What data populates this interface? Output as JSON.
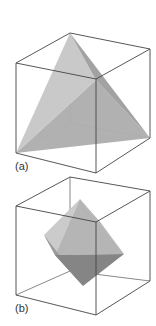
{
  "figures": [
    {
      "id": "a",
      "label": "(a)",
      "shape": "tetrahedron inscribed in cube",
      "colors": {
        "left_face": "#c4c4c4",
        "right_face": "#9e9e9e",
        "bottom_face": "#b0b0b0"
      }
    },
    {
      "id": "b",
      "label": "(b)",
      "shape": "octahedron inscribed in cube",
      "colors": {
        "upper_left_face": "#c8c8c8",
        "upper_right_face": "#b2b2b2",
        "lower_left_face": "#8a8a8a",
        "lower_right_face": "#9c9c9c"
      }
    }
  ]
}
